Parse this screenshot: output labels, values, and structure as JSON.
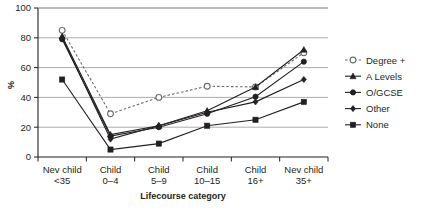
{
  "chart_data": {
    "type": "line",
    "title": "",
    "xlabel": "Lifecourse category",
    "ylabel": "%",
    "ylim": [
      0,
      100
    ],
    "yticks": [
      0,
      20,
      40,
      60,
      80,
      100
    ],
    "grid": true,
    "legend_position": "right",
    "categories": [
      "Nev child <35",
      "Child 0–4",
      "Child 5–9",
      "Child 10–15",
      "Child 16+",
      "Nev child 35+"
    ],
    "category_lines": [
      [
        "Nev child",
        "<35"
      ],
      [
        "Child",
        "0–4"
      ],
      [
        "Child",
        "5–9"
      ],
      [
        "Child",
        "10–15"
      ],
      [
        "Child",
        "16+"
      ],
      [
        "Nev child",
        "35+"
      ]
    ],
    "series": [
      {
        "name": "Degree +",
        "marker": "open-circle",
        "line_style": "dashed",
        "color": "#6d6d6d",
        "values": [
          85,
          29,
          40,
          47.5,
          47,
          70
        ]
      },
      {
        "name": "A Levels",
        "marker": "triangle",
        "line_style": "solid",
        "color": "#231f20",
        "values": [
          81,
          15,
          21,
          31,
          47,
          72
        ]
      },
      {
        "name": "O/GCSE",
        "marker": "filled-circle",
        "line_style": "solid",
        "color": "#231f20",
        "values": [
          79,
          14,
          20,
          29,
          40.5,
          64
        ]
      },
      {
        "name": "Other",
        "marker": "diamond",
        "line_style": "solid",
        "color": "#231f20",
        "values": [
          80,
          12,
          21,
          30,
          37,
          52
        ]
      },
      {
        "name": "None",
        "marker": "filled-square",
        "line_style": "solid",
        "color": "#231f20",
        "values": [
          52,
          5,
          9,
          21,
          25,
          37
        ]
      }
    ]
  }
}
